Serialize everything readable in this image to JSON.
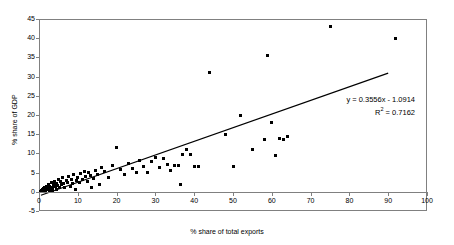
{
  "chart_data": {
    "type": "scatter",
    "title": "",
    "xlabel": "% share of total exports",
    "ylabel": "% share of GDP",
    "xlim": [
      0,
      100
    ],
    "ylim": [
      -5,
      45
    ],
    "xticks": [
      0,
      10,
      20,
      30,
      40,
      50,
      60,
      70,
      80,
      90,
      100
    ],
    "yticks": [
      -5,
      0,
      5,
      10,
      15,
      20,
      25,
      30,
      35,
      40,
      45
    ],
    "grid": false,
    "legend": "none",
    "annotations": [
      "y = 0.3556x - 1.0914",
      "R² = 0.7162"
    ],
    "trendline": {
      "type": "linear",
      "slope": 0.3556,
      "intercept": -1.0914,
      "r_squared": 0.7162,
      "x_start": 0.5,
      "x_end": 90
    },
    "points": [
      [
        0.4,
        0.1
      ],
      [
        0.6,
        0.3
      ],
      [
        0.8,
        0.0
      ],
      [
        0.9,
        0.6
      ],
      [
        1.0,
        0.2
      ],
      [
        1.2,
        0.9
      ],
      [
        1.3,
        0.4
      ],
      [
        1.5,
        1.2
      ],
      [
        1.6,
        0.1
      ],
      [
        1.8,
        0.7
      ],
      [
        2.0,
        1.5
      ],
      [
        2.1,
        0.5
      ],
      [
        2.3,
        1.0
      ],
      [
        2.5,
        2.0
      ],
      [
        2.6,
        0.3
      ],
      [
        2.8,
        1.4
      ],
      [
        3.0,
        0.8
      ],
      [
        3.2,
        2.4
      ],
      [
        3.4,
        1.1
      ],
      [
        3.6,
        0.4
      ],
      [
        3.8,
        1.9
      ],
      [
        4.0,
        2.8
      ],
      [
        4.2,
        1.3
      ],
      [
        4.4,
        0.7
      ],
      [
        4.6,
        2.2
      ],
      [
        4.8,
        1.6
      ],
      [
        5.0,
        3.2
      ],
      [
        5.2,
        1.0
      ],
      [
        5.5,
        2.6
      ],
      [
        5.8,
        1.8
      ],
      [
        6.0,
        3.6
      ],
      [
        6.3,
        2.1
      ],
      [
        6.6,
        1.2
      ],
      [
        7.0,
        3.0
      ],
      [
        7.3,
        2.5
      ],
      [
        7.6,
        4.0
      ],
      [
        8.0,
        1.5
      ],
      [
        8.3,
        3.3
      ],
      [
        8.6,
        2.2
      ],
      [
        9.0,
        4.4
      ],
      [
        9.3,
        0.6
      ],
      [
        9.6,
        2.9
      ],
      [
        10.0,
        3.7
      ],
      [
        10.4,
        2.3
      ],
      [
        10.8,
        4.8
      ],
      [
        11.2,
        3.1
      ],
      [
        11.6,
        5.4
      ],
      [
        12.0,
        3.9
      ],
      [
        12.4,
        2.7
      ],
      [
        12.8,
        5.0
      ],
      [
        13.2,
        4.2
      ],
      [
        13.6,
        1.0
      ],
      [
        14.0,
        3.4
      ],
      [
        14.5,
        5.6
      ],
      [
        15.0,
        4.6
      ],
      [
        15.5,
        2.0
      ],
      [
        16.0,
        6.2
      ],
      [
        17.0,
        5.2
      ],
      [
        18.0,
        3.8
      ],
      [
        19.0,
        6.8
      ],
      [
        20.0,
        11.6
      ],
      [
        21.0,
        5.9
      ],
      [
        22.0,
        4.4
      ],
      [
        23.0,
        7.4
      ],
      [
        24.0,
        6.1
      ],
      [
        25.0,
        5.0
      ],
      [
        26.0,
        8.2
      ],
      [
        27.0,
        6.6
      ],
      [
        28.0,
        4.9
      ],
      [
        29.0,
        7.8
      ],
      [
        30.0,
        9.0
      ],
      [
        31.0,
        6.4
      ],
      [
        32.0,
        8.6
      ],
      [
        33.0,
        7.0
      ],
      [
        34.0,
        5.5
      ],
      [
        35.0,
        6.9
      ],
      [
        36.0,
        6.8
      ],
      [
        36.5,
        2.0
      ],
      [
        37.0,
        9.6
      ],
      [
        38.0,
        11.0
      ],
      [
        39.0,
        9.8
      ],
      [
        40.0,
        6.6
      ],
      [
        41.0,
        6.5
      ],
      [
        44.0,
        31.0
      ],
      [
        48.0,
        15.0
      ],
      [
        50.0,
        6.5
      ],
      [
        52.0,
        20.0
      ],
      [
        55.0,
        11.0
      ],
      [
        58.0,
        13.5
      ],
      [
        59.0,
        35.5
      ],
      [
        60.0,
        18.0
      ],
      [
        61.0,
        9.5
      ],
      [
        62.0,
        14.0
      ],
      [
        63.0,
        13.5
      ],
      [
        64.0,
        14.5
      ],
      [
        75.0,
        43.0
      ],
      [
        92.0,
        40.0
      ]
    ]
  }
}
